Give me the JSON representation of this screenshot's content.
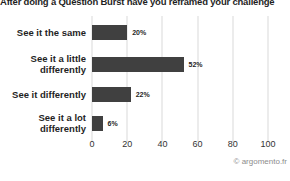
{
  "title": "After doing a Question Burst have you reframed your challenge",
  "attribution": "© argomento.fr",
  "chart_data": {
    "type": "bar",
    "orientation": "horizontal",
    "title": "After doing a Question Burst have you reframed your challenge",
    "categories": [
      "See it the same",
      "See it a little differently",
      "See it differently",
      "See it a lot differently"
    ],
    "values": [
      20,
      52,
      22,
      6
    ],
    "value_labels": [
      "20%",
      "52%",
      "22%",
      "6%"
    ],
    "xlabel": "",
    "ylabel": "",
    "xlim": [
      0,
      100
    ],
    "xticks": [
      0,
      20,
      40,
      60,
      80,
      100
    ],
    "grid": true,
    "legend": false,
    "bar_color": "#404040",
    "gridline_color": "#d9d9d9"
  }
}
